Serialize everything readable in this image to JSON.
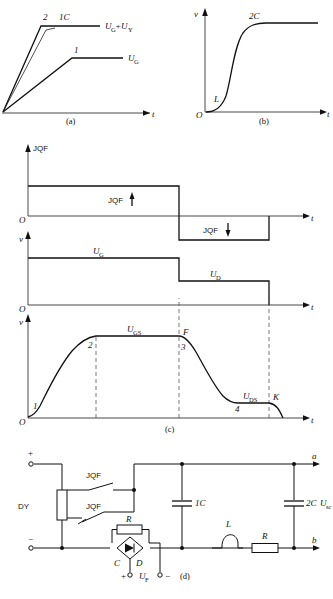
{
  "figure": {
    "title_caption": "(d)",
    "panels": [
      {
        "id": "a",
        "label": "(a)"
      },
      {
        "id": "b",
        "label": "(b)"
      },
      {
        "id": "c",
        "label": "(c)"
      },
      {
        "id": "d",
        "label": "(d)"
      }
    ]
  },
  "panel_a": {
    "label": "(a)",
    "y_axis": "",
    "x_axis": "t",
    "curve_upper_label": "U_G+U_Y",
    "curve_upper_text": "U",
    "curve_upper_sub": "G",
    "curve_upper_plus": "+U",
    "curve_upper_sub2": "Y",
    "curve_lower_text": "U",
    "curve_lower_sub": "G",
    "point_2": "2",
    "point_1": "1",
    "cap_label": "1C"
  },
  "panel_b": {
    "label": "(b)",
    "y_axis": "v",
    "x_axis": "t",
    "origin": "O",
    "knee_label": "L",
    "plateau_label": "2C"
  },
  "panel_c": {
    "label": "(c)",
    "chart1": {
      "y_axis": "JQF",
      "x_axis": "t",
      "origin": "O",
      "pulse_pos_label": "JQF",
      "pulse_pos_arrow": "↑",
      "pulse_neg_label": "JQF",
      "pulse_neg_arrow": "↓"
    },
    "chart2": {
      "y_axis": "v",
      "x_axis": "t",
      "origin": "O",
      "level_high_text": "U",
      "level_high_sub": "G",
      "level_low_text": "U",
      "level_low_sub": "D"
    },
    "chart3": {
      "y_axis": "v",
      "x_axis": "t",
      "origin": "O",
      "plateau_text": "U",
      "plateau_sub": "GS",
      "tail_text": "U",
      "tail_sub": "DS",
      "pt1": "1",
      "pt2": "2",
      "pt3": "3",
      "pt4": "4",
      "ptF": "F",
      "ptK": "K"
    }
  },
  "panel_d": {
    "label": "(d)",
    "source_label": "DY",
    "terminal_plus": "+",
    "terminal_minus": "−",
    "relay_top_label": "JQF",
    "relay_bottom_label": "JQF",
    "cap1_label": "1C",
    "cap2_label": "2C",
    "cap2_voltage_text": "U",
    "cap2_voltage_sub": "sc",
    "resistor_top_label": "R",
    "resistor_right_label": "R",
    "inductor_label": "L",
    "bridge_left_label": "C",
    "bridge_right_label": "D",
    "out_plus": "+",
    "out_minus": "−",
    "uf_text": "U",
    "uf_sub": "F",
    "node_a": "a",
    "node_b": "b"
  }
}
